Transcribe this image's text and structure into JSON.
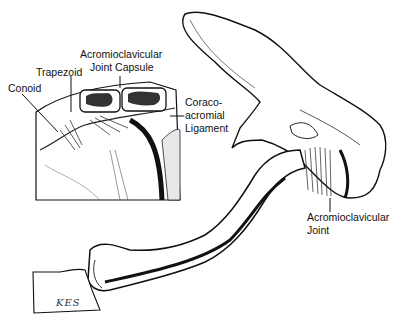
{
  "figure": {
    "labels": {
      "conoid": "Conoid",
      "trapezoid": "Trapezoid",
      "ac_capsule_line1": "Acromioclavicular",
      "ac_capsule_line2": "Joint Capsule",
      "coracoacromial_line1": "Coraco-",
      "coracoacromial_line2": "acromial",
      "coracoacromial_line3": "Ligament",
      "ac_joint_line1": "Acromioclavicular",
      "ac_joint_line2": "Joint"
    },
    "signature": "KES"
  }
}
